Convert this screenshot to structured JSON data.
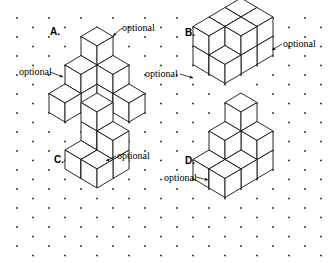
{
  "grid": {
    "x0": 17,
    "y0": 18,
    "dx": 32,
    "dy": 9.5,
    "rows": 26,
    "cols": 10,
    "dot_color": "#222"
  },
  "iso": {
    "ux": 16,
    "uy": 9.5,
    "uz": 19
  },
  "figures": [
    {
      "id": "A",
      "label": "A.",
      "label_pos": [
        50,
        26
      ],
      "origin": [
        97,
        84
      ],
      "cubes": [
        [
          0,
          2,
          0
        ],
        [
          0,
          1,
          0
        ],
        [
          2,
          0,
          0
        ],
        [
          1,
          0,
          0
        ],
        [
          0,
          0,
          0
        ],
        [
          0,
          1,
          1
        ],
        [
          1,
          0,
          1
        ],
        [
          0,
          0,
          1
        ],
        [
          0,
          0,
          2
        ]
      ],
      "optional": [
        {
          "text": "optional",
          "pos": [
            122,
            22
          ],
          "arrow": [
            [
              122,
              28
            ],
            [
              113,
              36
            ]
          ]
        },
        {
          "text": "optional",
          "pos": [
            19,
            66
          ],
          "arrow": [
            [
              50,
              72
            ],
            [
              63,
              77
            ]
          ]
        }
      ]
    },
    {
      "id": "B",
      "label": "B.",
      "label_pos": [
        185,
        27
      ],
      "origin": [
        241,
        36
      ],
      "cubes": [
        [
          0,
          0,
          0
        ],
        [
          0,
          1,
          0
        ],
        [
          0,
          2,
          0
        ],
        [
          1,
          0,
          0
        ],
        [
          1,
          1,
          0
        ],
        [
          1,
          2,
          0
        ],
        [
          0,
          0,
          1
        ],
        [
          0,
          1,
          1
        ],
        [
          0,
          2,
          1
        ],
        [
          1,
          0,
          1
        ],
        [
          1,
          1,
          1
        ]
      ],
      "optional": [
        {
          "text": "optional",
          "pos": [
            283,
            38
          ],
          "arrow": [
            [
              282,
              44
            ],
            [
              272,
              50
            ]
          ]
        },
        {
          "text": "optional",
          "pos": [
            145,
            68
          ],
          "arrow": [
            [
              180,
              74
            ],
            [
              193,
              78
            ]
          ]
        }
      ]
    },
    {
      "id": "C",
      "label": "C.",
      "label_pos": [
        54,
        154
      ],
      "origin": [
        97,
        150
      ],
      "cubes": [
        [
          0,
          0,
          0
        ],
        [
          1,
          0,
          0
        ],
        [
          0,
          1,
          0
        ],
        [
          1,
          1,
          0
        ],
        [
          0,
          0,
          1
        ],
        [
          1,
          0,
          1
        ],
        [
          0,
          0,
          2
        ]
      ],
      "optional": [
        {
          "text": "optional",
          "pos": [
            117,
            150
          ],
          "arrow": [
            [
              116,
              156
            ],
            [
              106,
              161
            ]
          ]
        }
      ]
    },
    {
      "id": "D",
      "label": "D.",
      "label_pos": [
        185,
        155
      ],
      "origin": [
        241,
        150
      ],
      "cubes": [
        [
          0,
          0,
          0
        ],
        [
          1,
          0,
          0
        ],
        [
          0,
          1,
          0
        ],
        [
          1,
          1,
          0
        ],
        [
          0,
          2,
          0
        ],
        [
          1,
          2,
          0
        ],
        [
          0,
          0,
          1
        ],
        [
          1,
          0,
          1
        ],
        [
          0,
          1,
          1
        ],
        [
          0,
          0,
          2
        ]
      ],
      "optional": [
        {
          "text": "optional",
          "pos": [
            164,
            172
          ],
          "arrow": [
            [
              196,
              177
            ],
            [
              208,
              180
            ]
          ]
        }
      ]
    }
  ]
}
